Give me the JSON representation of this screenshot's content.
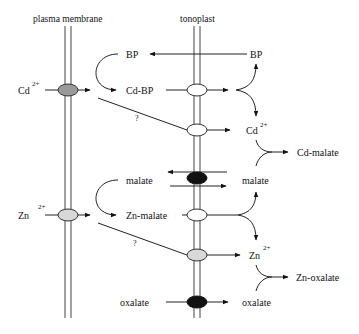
{
  "membranes": {
    "plasma_membrane": "plasma membrane",
    "tonoplast": "tonoplast"
  },
  "cadmium_pathway": {
    "ion": "Cd",
    "ion_charge": "2+",
    "ligand_cytosol": "BP",
    "complex": "Cd-BP",
    "ligand_vacuole": "BP",
    "unknown_route": "?",
    "vacuole_ion": "Cd",
    "vacuole_ion_charge": "2+",
    "vacuole_product": "Cd-malate"
  },
  "zinc_pathway": {
    "ion": "Zn",
    "ion_charge": "2+",
    "ligand_cytosol": "malate",
    "complex": "Zn-malate",
    "ligand_vacuole": "malate",
    "unknown_route": "?",
    "vacuole_ion": "Zn",
    "vacuole_ion_charge": "2+",
    "vacuole_product": "Zn-oxalate"
  },
  "oxalate_transport": {
    "cytosol": "oxalate",
    "vacuole": "oxalate"
  },
  "colors": {
    "line": "#222222",
    "transporter_dark": "#111111",
    "transporter_grey": "#9a9a9a",
    "transporter_light": "#d8d8d8",
    "transporter_white": "#ffffff"
  }
}
